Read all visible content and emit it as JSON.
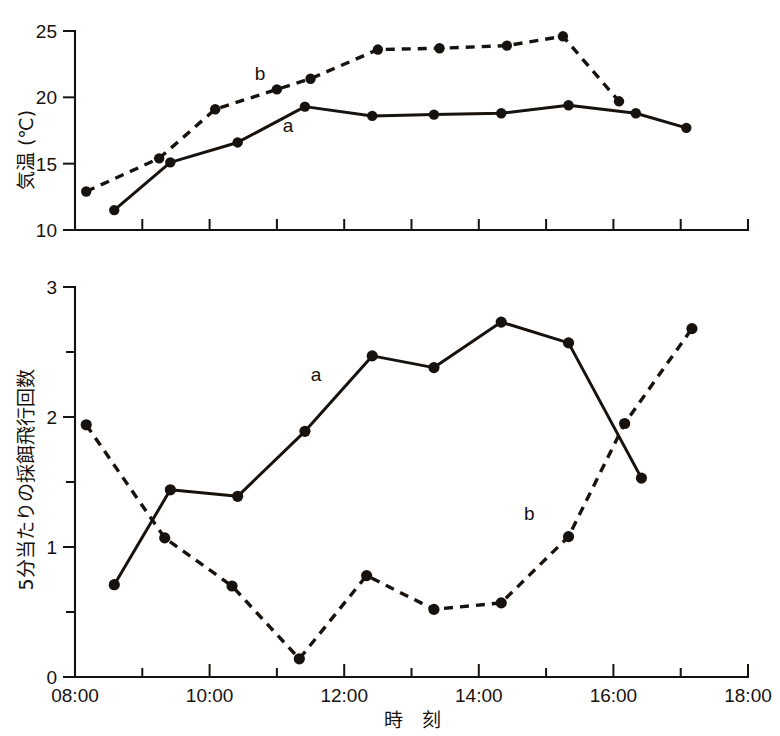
{
  "figure": {
    "background_color": "#ffffff",
    "ink_color": "#17120d"
  },
  "chart_data": [
    {
      "type": "line",
      "panel": "top",
      "title": "",
      "xlabel": "",
      "ylabel": "気温 (℃)",
      "xlim": [
        "08:00",
        "18:00"
      ],
      "ylim": [
        10,
        25
      ],
      "yticks": [
        10,
        15,
        20,
        25
      ],
      "ytick_labels": [
        "10",
        "15",
        "20",
        "25"
      ],
      "xticks": [
        "08:00",
        "09:00",
        "10:00",
        "11:00",
        "12:00",
        "13:00",
        "14:00",
        "15:00",
        "16:00",
        "17:00",
        "18:00"
      ],
      "xtick_labels": [
        "",
        "",
        "",
        "",
        "",
        "",
        "",
        "",
        "",
        "",
        ""
      ],
      "grid": false,
      "legend_position": "inline-annotation",
      "annotations": [
        {
          "text": "b",
          "x": "10:45",
          "y": 21.3
        },
        {
          "text": "a",
          "x": "11:10",
          "y": 17.4
        }
      ],
      "series": [
        {
          "name": "a",
          "style": "solid",
          "marker": "filled-circle",
          "x": [
            "08:35",
            "09:25",
            "10:25",
            "11:25",
            "12:25",
            "13:20",
            "14:20",
            "15:20",
            "16:20",
            "17:05"
          ],
          "values": [
            11.5,
            15.1,
            16.6,
            19.3,
            18.6,
            18.7,
            18.8,
            19.4,
            18.8,
            17.7
          ]
        },
        {
          "name": "b",
          "style": "dashed",
          "marker": "filled-circle",
          "x": [
            "08:10",
            "09:15",
            "10:05",
            "11:00",
            "11:30",
            "12:30",
            "13:25",
            "14:25",
            "15:15",
            "16:05"
          ],
          "values": [
            12.9,
            15.4,
            19.1,
            20.6,
            21.4,
            23.6,
            23.7,
            23.9,
            24.6,
            19.7
          ]
        }
      ]
    },
    {
      "type": "line",
      "panel": "bottom",
      "title": "",
      "xlabel": "時　刻",
      "ylabel": "5分当たりの採餌飛行回数",
      "xlim": [
        "08:00",
        "18:00"
      ],
      "ylim": [
        0,
        3
      ],
      "yticks": [
        0,
        0.5,
        1,
        1.5,
        2,
        2.5,
        3
      ],
      "ytick_labels": [
        "0",
        "",
        "1",
        "",
        "2",
        "",
        "3"
      ],
      "xticks": [
        "08:00",
        "09:00",
        "10:00",
        "11:00",
        "12:00",
        "13:00",
        "14:00",
        "15:00",
        "16:00",
        "17:00",
        "18:00"
      ],
      "xtick_labels": [
        "08:00",
        "",
        "10:00",
        "",
        "12:00",
        "",
        "14:00",
        "",
        "16:00",
        "",
        "18:00"
      ],
      "grid": false,
      "legend_position": "inline-annotation",
      "annotations": [
        {
          "text": "a",
          "x": "11:35",
          "y": 2.28
        },
        {
          "text": "b",
          "x": "14:45",
          "y": 1.21
        }
      ],
      "series": [
        {
          "name": "a",
          "style": "solid",
          "marker": "filled-circle",
          "x": [
            "08:35",
            "09:25",
            "10:25",
            "11:25",
            "12:25",
            "13:20",
            "14:20",
            "15:20",
            "16:25"
          ],
          "values": [
            0.71,
            1.44,
            1.39,
            1.89,
            2.47,
            2.38,
            2.73,
            2.57,
            1.53
          ]
        },
        {
          "name": "b",
          "style": "dashed",
          "marker": "filled-circle",
          "x": [
            "08:10",
            "09:20",
            "10:20",
            "11:20",
            "12:20",
            "13:20",
            "14:20",
            "15:20",
            "16:10",
            "17:10"
          ],
          "values": [
            1.94,
            1.07,
            0.7,
            0.14,
            0.78,
            0.52,
            0.57,
            1.08,
            1.95,
            2.68
          ]
        }
      ]
    }
  ]
}
